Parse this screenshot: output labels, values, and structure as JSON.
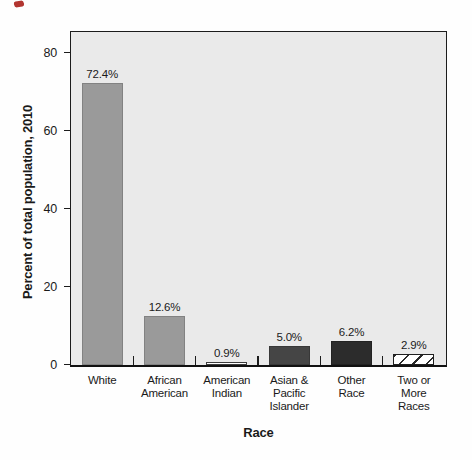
{
  "page": {
    "background": "#fefefe",
    "red_ink_mark_color": "#b23530"
  },
  "chart_data": {
    "type": "bar",
    "title": "",
    "xlabel": "Race",
    "ylabel": "Percent of total population, 2010",
    "categories": [
      "White",
      "African American",
      "American Indian",
      "Asian & Pacific Islander",
      "Other Race",
      "Two or More Races"
    ],
    "category_label_lines": [
      [
        "White"
      ],
      [
        "African",
        "American"
      ],
      [
        "American",
        "Indian"
      ],
      [
        "Asian &",
        "Pacific",
        "Islander"
      ],
      [
        "Other",
        "Race"
      ],
      [
        "Two or",
        "More",
        "Races"
      ]
    ],
    "values": [
      72.4,
      12.6,
      0.9,
      5.0,
      6.2,
      2.9
    ],
    "value_labels": [
      "72.4%",
      "12.6%",
      "0.9%",
      "5.0%",
      "6.2%",
      "2.9%"
    ],
    "yticks": [
      0,
      20,
      40,
      60,
      80
    ],
    "ylim": [
      0,
      85
    ],
    "grid": false,
    "legend": null,
    "plot_background": "#eaeaea",
    "frame_color": "#1c1c1c",
    "text_color": "#1a1a1a",
    "bar_styles": [
      {
        "fill": "#9a9a9a",
        "border": "#828282",
        "pattern": "solid"
      },
      {
        "fill": "#9a9a9a",
        "border": "#828282",
        "pattern": "solid"
      },
      {
        "fill": "#ffffff",
        "border": "#3c3c3c",
        "pattern": "solid"
      },
      {
        "fill": "#454545",
        "border": "#383838",
        "pattern": "solid"
      },
      {
        "fill": "#2c2c2c",
        "border": "#222222",
        "pattern": "solid"
      },
      {
        "fill": "#ffffff",
        "border": "#1f1f1f",
        "pattern": "diagonal-hatch",
        "hatch_color": "#2a2a2a"
      }
    ]
  }
}
